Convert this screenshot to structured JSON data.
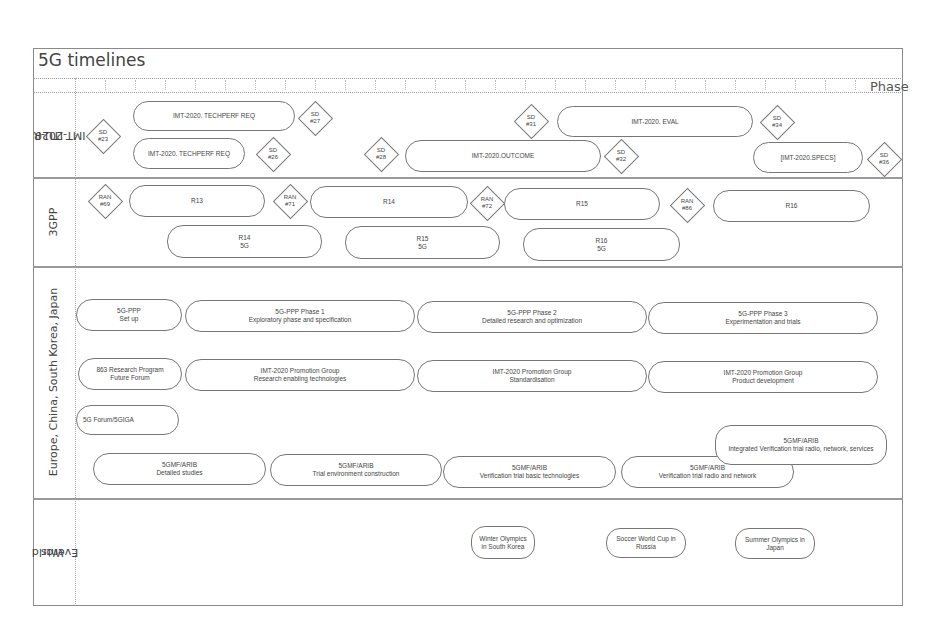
{
  "header": {
    "title": "5G timelines",
    "phase_label": "Phase"
  },
  "rows": {
    "itu": "ITU-R\nIMT-2020",
    "itu_l1": "ITU-R",
    "itu_l2": "IMT-2020",
    "gpp": "3GPP",
    "regional": "Europe, China, South Korea, Japan",
    "events_l1": "World",
    "events_l2": "Events"
  },
  "itu": {
    "diamonds": [
      {
        "l1": "SD",
        "l2": "#23"
      },
      {
        "l1": "SD",
        "l2": "#27"
      },
      {
        "l1": "SD",
        "l2": "#26"
      },
      {
        "l1": "SD",
        "l2": "#28"
      },
      {
        "l1": "SD",
        "l2": "#31"
      },
      {
        "l1": "SD",
        "l2": "#32"
      },
      {
        "l1": "SD",
        "l2": "#34"
      },
      {
        "l1": "SD",
        "l2": "#36"
      }
    ],
    "bars": [
      {
        "label": "IMT-2020. TECHPERF REQ"
      },
      {
        "label": "IMT-2020. TECHPERF REQ"
      },
      {
        "label": "IMT-2020.OUTCOME"
      },
      {
        "label": "IMT-2020. EVAL"
      },
      {
        "label": "[IMT-2020.SPECS]"
      }
    ]
  },
  "gpp": {
    "diamonds": [
      {
        "l1": "RAN",
        "l2": "#69"
      },
      {
        "l1": "RAN",
        "l2": "#71"
      },
      {
        "l1": "RAN",
        "l2": "#72"
      },
      {
        "l1": "RAN",
        "l2": "#86"
      }
    ],
    "releases": [
      {
        "label": "R13"
      },
      {
        "label": "R14"
      },
      {
        "label": "R15"
      },
      {
        "label": "R16"
      }
    ],
    "releases_5g": [
      {
        "l1": "R14",
        "l2": "5G"
      },
      {
        "l1": "R15",
        "l2": "5G"
      },
      {
        "l1": "R16",
        "l2": "5G"
      }
    ]
  },
  "regional": {
    "ppp": [
      {
        "l1": "5G-PPP",
        "l2": "Set up"
      },
      {
        "l1": "5G-PPP Phase 1",
        "l2": "Exploratory phase and specification"
      },
      {
        "l1": "5G-PPP Phase 2",
        "l2": "Detailed research and optimization"
      },
      {
        "l1": "5G-PPP Phase 3",
        "l2": "Experimentation and trials"
      }
    ],
    "china": [
      {
        "l1": "863 Research Program",
        "l2": "Future Forum"
      },
      {
        "l1": "IMT-2020 Promotion Group",
        "l2": "Research enabling technologies"
      },
      {
        "l1": "IMT-2020 Promotion Group",
        "l2": "Standardisation"
      },
      {
        "l1": "IMT-2020 Promotion Group",
        "l2": "Product development"
      }
    ],
    "korea": [
      {
        "l1": "5G Forum/5GIGA",
        "l2": ""
      }
    ],
    "japan": [
      {
        "l1": "5GMF/ARIB",
        "l2": "Detailed studies"
      },
      {
        "l1": "5GMF/ARIB",
        "l2": "Trial environment construction"
      },
      {
        "l1": "5GMF/ARIB",
        "l2": "Verification trial basic technologies"
      },
      {
        "l1": "5GMF/ARIB",
        "l2": "Verification trial radio and network"
      },
      {
        "l1": "5GMF/ARIB",
        "l2": "Integrated Verification trial radio, network, services"
      }
    ]
  },
  "events": [
    {
      "label": "Winter Olympics in South Korea"
    },
    {
      "label": "Soccer World Cup in Russia"
    },
    {
      "label": "Summer Olympics in Japan"
    }
  ]
}
